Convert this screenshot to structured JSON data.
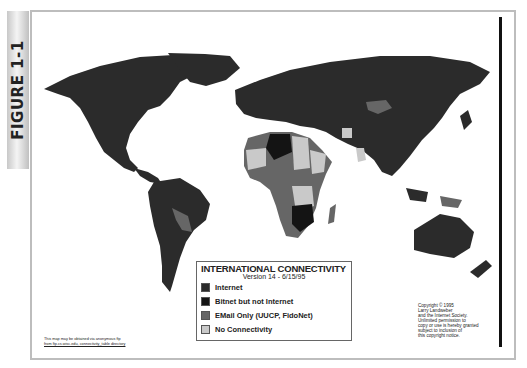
{
  "figure": {
    "label": "FIGURE 1-1"
  },
  "legend": {
    "title": "INTERNATIONAL CONNECTIVITY",
    "subtitle": "Version 14 - 6/15/95",
    "items": [
      {
        "label": "Internet",
        "color": "#2b2b2b"
      },
      {
        "label": "Bitnet but not Internet",
        "color": "#141414"
      },
      {
        "label": "EMail Only (UUCP, FidoNet)",
        "color": "#666666"
      },
      {
        "label": "No Connectivity",
        "color": "#c9c9c9"
      }
    ]
  },
  "copyright": {
    "lines": [
      "Copyright © 1995",
      "Larry Landweber",
      "and the Internet Society.",
      "Unlimited permission to",
      "copy or use is hereby granted",
      "subject to inclusion of",
      "this copyright notice."
    ]
  },
  "source_note": {
    "line1": "This map may be obtained via anonymous ftp",
    "line2": "from ftp.cs.wisc.edu, connectivity_table directory"
  },
  "colors": {
    "internet": "#2b2b2b",
    "bitnet": "#141414",
    "email": "#666666",
    "none": "#c9c9c9"
  }
}
